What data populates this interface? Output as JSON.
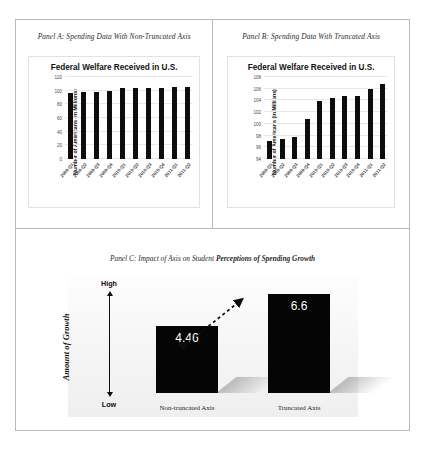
{
  "panels": {
    "a": {
      "caption": "Panel A: Spending Data With Non-Truncated Axis",
      "chart_title": "Federal Welfare Received in U.S.",
      "ylabel": "Number of Americans (in Millions)"
    },
    "b": {
      "caption": "Panel B: Spending Data With Truncated Axis",
      "chart_title": "Federal Welfare Received in U.S.",
      "ylabel": "Number of Americans (in Millions)"
    },
    "c": {
      "caption_plain": "Panel C: Impact of Axis on Student ",
      "caption_bold": "Perceptions of Spending Growth",
      "ylabel": "Amount of Growth",
      "axis_high": "High",
      "axis_low": "Low"
    }
  },
  "bottom_caption": "",
  "chart_data": [
    {
      "type": "bar",
      "title": "Federal Welfare Received in U.S.",
      "panel": "A",
      "xlabel": "",
      "ylabel": "Number of Americans (in Millions)",
      "categories": [
        "2009-Q1",
        "2009-Q2",
        "2009-Q3",
        "2009-Q4",
        "2010-Q1",
        "2010-Q2",
        "2010-Q3",
        "2010-Q4",
        "2011-Q1",
        "2011-Q2"
      ],
      "values": [
        97,
        97.5,
        97.8,
        100,
        103.5,
        103.8,
        104.5,
        104.5,
        105,
        106
      ],
      "ylim": [
        0,
        120
      ],
      "yticks": [
        0,
        20,
        40,
        60,
        80,
        100,
        120
      ],
      "grid": true,
      "legend": "none"
    },
    {
      "type": "bar",
      "title": "Federal Welfare Received in U.S.",
      "panel": "B",
      "xlabel": "",
      "ylabel": "Number of Americans (in Millions)",
      "categories": [
        "2009-Q1",
        "2009-Q2",
        "2009-Q3",
        "2009-Q4",
        "2010-Q1",
        "2010-Q2",
        "2010-Q3",
        "2010-Q4",
        "2011-Q1",
        "2011-Q2"
      ],
      "values": [
        97,
        97.5,
        97.8,
        100.8,
        103.9,
        104.4,
        104.8,
        104.8,
        105.9,
        106.8
      ],
      "ylim": [
        94,
        108
      ],
      "yticks": [
        94,
        96,
        98,
        100,
        102,
        104,
        106,
        108
      ],
      "grid": true,
      "legend": "none"
    },
    {
      "type": "bar",
      "title": "Panel C: Impact of Axis on Student Perceptions of Spending Growth",
      "panel": "C",
      "xlabel": "",
      "ylabel": "Amount of Growth",
      "categories": [
        "Non-truncated Axis",
        "Truncated Axis"
      ],
      "values": [
        4.46,
        6.6
      ],
      "value_labels": [
        "4.46",
        "6.6"
      ],
      "ylim": [
        0,
        8
      ],
      "grid": false,
      "legend": "none",
      "annotation": "double-headed dotted arrow between bar tops"
    }
  ]
}
